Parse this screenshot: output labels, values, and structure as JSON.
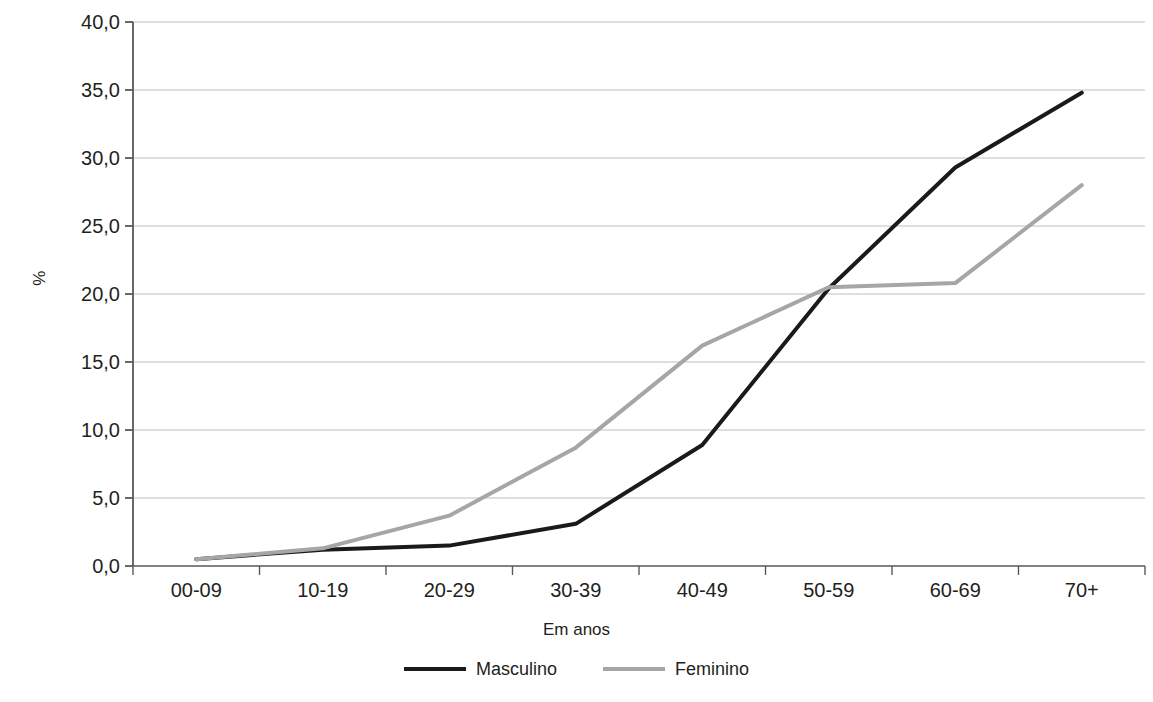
{
  "chart_data": {
    "type": "line",
    "title": "",
    "subtitle": "",
    "xlabel": "Em anos",
    "ylabel": "%",
    "categories": [
      "00-09",
      "10-19",
      "20-29",
      "30-39",
      "40-49",
      "50-59",
      "60-69",
      "70+"
    ],
    "series": [
      {
        "name": "Masculino",
        "color": "#1a1a1a",
        "line_width": 4,
        "values": [
          0.5,
          1.2,
          1.5,
          3.1,
          8.9,
          20.4,
          29.3,
          34.8
        ]
      },
      {
        "name": "Feminino",
        "color": "#a6a6a6",
        "line_width": 4,
        "values": [
          0.5,
          1.3,
          3.7,
          8.7,
          16.2,
          20.5,
          20.8,
          28.0
        ]
      }
    ],
    "ylim": [
      0,
      40
    ],
    "ytick_step": 5,
    "ytick_labels": [
      "0,0",
      "5,0",
      "10,0",
      "15,0",
      "20,0",
      "25,0",
      "30,0",
      "35,0",
      "40,0"
    ],
    "ytick_values": [
      0,
      5,
      10,
      15,
      20,
      25,
      30,
      35,
      40
    ],
    "grid": "horizontal",
    "grid_color": "#bfbfbf",
    "axis_color": "#595959",
    "legend_position": "bottom",
    "background": "#ffffff"
  },
  "legend": {
    "entries": [
      {
        "label": "Masculino"
      },
      {
        "label": "Feminino"
      }
    ]
  },
  "axes": {
    "y_title": "%",
    "x_title": "Em anos"
  }
}
